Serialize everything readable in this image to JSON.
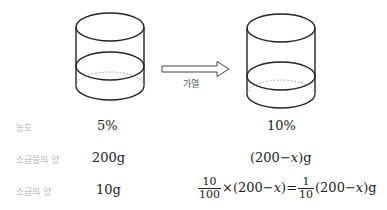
{
  "diagram": {
    "arrow_label": "가열",
    "before": {
      "concentration": "5%",
      "solution_amount": "200g",
      "salt_amount": "10g"
    },
    "after": {
      "concentration": "10%",
      "solution_amount": {
        "open": "(200",
        "minus": "−",
        "var": "x",
        "close": ")g"
      },
      "salt_equation": {
        "frac1_num": "10",
        "frac1_den": "100",
        "times": "×",
        "paren1_open": "(200",
        "minus": "−",
        "var": "x",
        "paren1_close": ")",
        "equals": "=",
        "frac2_num": "1",
        "frac2_den": "10",
        "paren2_open": "(200",
        "paren2_close": ")g"
      }
    },
    "row_labels": {
      "concentration": "농도",
      "solution_amount": "소금물의 양",
      "salt_amount": "소금의 양"
    }
  }
}
